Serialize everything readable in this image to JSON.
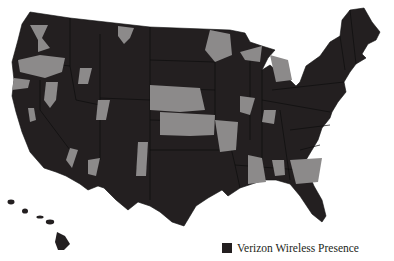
{
  "map": {
    "title": "Verizon Wireless coverage map",
    "colors": {
      "presence": "#231f20",
      "no_presence": "#8c8a8a",
      "borders": "#111111",
      "background": "#ffffff"
    },
    "regions_shown": [
      "Contiguous United States",
      "Hawaii"
    ]
  },
  "legend": {
    "label": "Verizon Wireless Presence",
    "swatch_color": "#231f20"
  }
}
